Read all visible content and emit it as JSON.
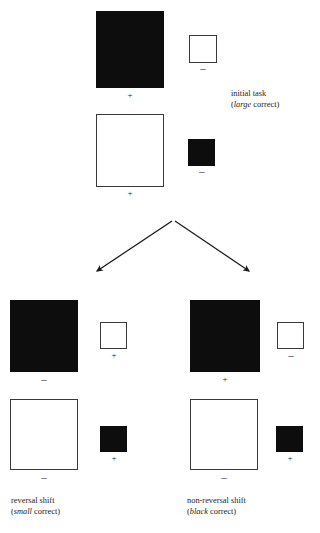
{
  "figure": {
    "top_partial_text": "discrimination-shift learning paradigm",
    "signs": {
      "plus": "+",
      "minus": "–"
    },
    "panels": [
      {
        "id": "initial-task",
        "caption_line1": "initial task",
        "caption_emphasis": "large",
        "caption_rest": " correct)",
        "caption_open": "(",
        "rows": [
          {
            "large": {
              "fill": "black",
              "sign": "+"
            },
            "small": {
              "fill": "white",
              "sign": "–"
            }
          },
          {
            "large": {
              "fill": "white",
              "sign": "+"
            },
            "small": {
              "fill": "black",
              "sign": "–"
            }
          }
        ]
      },
      {
        "id": "reversal-shift",
        "caption_line1": "reversal shift",
        "caption_emphasis": "small",
        "caption_rest": " correct)",
        "caption_open": "(",
        "rows": [
          {
            "large": {
              "fill": "black",
              "sign": "–"
            },
            "small": {
              "fill": "white",
              "sign": "+"
            }
          },
          {
            "large": {
              "fill": "white",
              "sign": "–"
            },
            "small": {
              "fill": "black",
              "sign": "+"
            }
          }
        ]
      },
      {
        "id": "non-reversal-shift",
        "caption_line1": "non-reversal shift",
        "caption_emphasis": "black",
        "caption_rest": " correct)",
        "caption_open": "(",
        "rows": [
          {
            "large": {
              "fill": "black",
              "sign": "+"
            },
            "small": {
              "fill": "white",
              "sign": "–"
            }
          },
          {
            "large": {
              "fill": "white",
              "sign": "–"
            },
            "small": {
              "fill": "black",
              "sign": "+"
            }
          }
        ]
      }
    ],
    "arrows": {
      "left_label": "to reversal shift",
      "right_label": "to non-reversal shift"
    }
  }
}
